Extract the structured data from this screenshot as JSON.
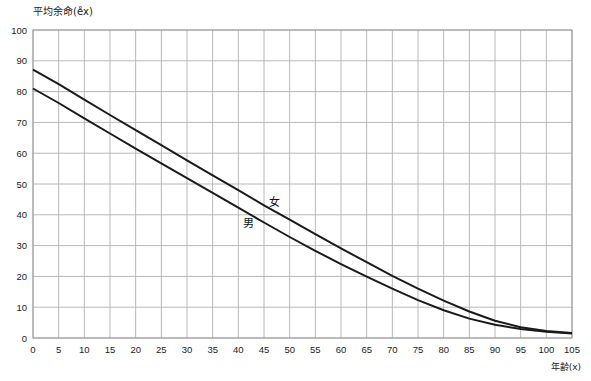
{
  "chart_data": {
    "type": "line",
    "title": "",
    "ylabel": "平均余命(e̊x)",
    "xlabel": "年齢(x)",
    "xlim": [
      0,
      105
    ],
    "ylim": [
      0,
      100
    ],
    "grid": true,
    "x_ticks": [
      0,
      5,
      10,
      15,
      20,
      25,
      30,
      35,
      40,
      45,
      50,
      55,
      60,
      65,
      70,
      75,
      80,
      85,
      90,
      95,
      100,
      105
    ],
    "y_ticks": [
      0,
      10,
      20,
      30,
      40,
      50,
      60,
      70,
      80,
      90,
      100
    ],
    "x": [
      0,
      5,
      10,
      15,
      20,
      25,
      30,
      35,
      40,
      45,
      50,
      55,
      60,
      65,
      70,
      75,
      80,
      85,
      90,
      95,
      100,
      105
    ],
    "series": [
      {
        "name": "女",
        "values": [
          87.1,
          82.4,
          77.4,
          72.4,
          67.5,
          62.6,
          57.7,
          52.8,
          48.0,
          43.1,
          38.4,
          33.7,
          29.1,
          24.6,
          20.2,
          16.0,
          12.1,
          8.6,
          5.6,
          3.5,
          2.3,
          1.6
        ]
      },
      {
        "name": "男",
        "values": [
          81.0,
          76.3,
          71.3,
          66.4,
          61.5,
          56.7,
          51.9,
          47.1,
          42.3,
          37.5,
          32.8,
          28.3,
          24.0,
          19.9,
          16.0,
          12.3,
          9.0,
          6.3,
          4.3,
          2.9,
          2.0,
          1.5
        ]
      }
    ],
    "annotations": [
      {
        "text": "女",
        "x": 47,
        "y": 43
      },
      {
        "text": "男",
        "x": 42,
        "y": 36
      }
    ]
  }
}
